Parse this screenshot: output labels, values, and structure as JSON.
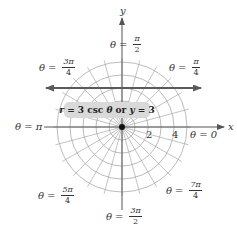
{
  "figure": {
    "center_px": [
      122,
      127
    ],
    "px_per_unit": 13,
    "circle_count": 5,
    "spoke_count": 24,
    "colors": {
      "grid": "#a9a9a9",
      "axis": "#555555",
      "curve": "#5a5a5a",
      "label_box": "#d9d9d9",
      "text": "#333333"
    }
  },
  "axes": {
    "x_label": "x",
    "y_label": "y",
    "ticks": [
      "2",
      "4"
    ]
  },
  "angle_labels": {
    "pi_over_2": {
      "theta": "θ",
      "eq": "=",
      "num": "π",
      "den": "2"
    },
    "three_pi_over_4": {
      "theta": "θ",
      "eq": "=",
      "num": "3π",
      "den": "4"
    },
    "pi_over_4": {
      "theta": "θ",
      "eq": "=",
      "num": "π",
      "den": "4"
    },
    "pi": {
      "text": "θ = π"
    },
    "zero": {
      "text": "θ = 0"
    },
    "five_pi_over_4": {
      "theta": "θ",
      "eq": "=",
      "num": "5π",
      "den": "4"
    },
    "seven_pi_over_4": {
      "theta": "θ",
      "eq": "=",
      "num": "7π",
      "den": "4"
    },
    "three_pi_over_2": {
      "theta": "θ",
      "eq": "=",
      "num": "3π",
      "den": "2"
    }
  },
  "curve_label": {
    "r": "r",
    "eq1": " = 3 csc ",
    "theta": "θ",
    "or": " or ",
    "y": "y",
    "eq2": " = 3"
  },
  "chart_data": {
    "type": "line",
    "title": "r = 3 csc θ or y = 3",
    "coordinate_system": "polar",
    "radial_grid": [
      1,
      2,
      3,
      4,
      5
    ],
    "angular_grid_step_deg": 15,
    "radial_tick_labels": [
      "2",
      "4"
    ],
    "angle_labels": [
      "θ = 0",
      "θ = π/4",
      "θ = π/2",
      "θ = 3π/4",
      "θ = π",
      "θ = 5π/4",
      "θ = 3π/2",
      "θ = 7π/4"
    ],
    "series": [
      {
        "name": "r = 3 csc θ (y = 3)",
        "x": [
          -6,
          6
        ],
        "y": [
          3,
          3
        ]
      }
    ],
    "xlabel": "x",
    "ylabel": "y",
    "xlim": [
      -6,
      6
    ],
    "ylim": [
      -6,
      6
    ]
  }
}
